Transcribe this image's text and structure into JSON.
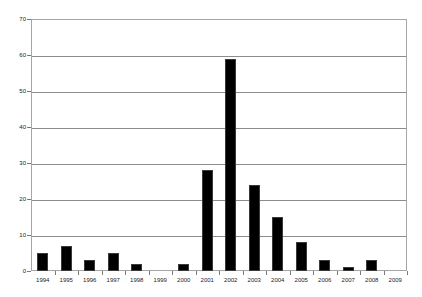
{
  "chart_data": {
    "type": "bar",
    "title": "",
    "subtitle": "",
    "xlabel": "",
    "ylabel": "",
    "categories": [
      "1994",
      "1995",
      "1996",
      "1997",
      "1998",
      "1999",
      "2000",
      "2001",
      "2002",
      "2003",
      "2004",
      "2005",
      "2006",
      "2007",
      "2008",
      "2009"
    ],
    "values": [
      5,
      7,
      3,
      5,
      2,
      0,
      2,
      28,
      59,
      24,
      15,
      8,
      3,
      1,
      3,
      0
    ],
    "ylim": [
      0,
      70
    ],
    "ytick_labels": [
      "0",
      "10",
      "20",
      "30",
      "40",
      "50",
      "60",
      "70"
    ],
    "ytick_values": [
      0,
      10,
      20,
      30,
      40,
      50,
      60,
      70
    ],
    "grid": true,
    "grid_axis": "y",
    "legend": false,
    "legend_position": "none",
    "series": [
      {
        "name": "",
        "values": [
          5,
          7,
          3,
          5,
          2,
          0,
          2,
          28,
          59,
          24,
          15,
          8,
          3,
          1,
          3,
          0
        ]
      }
    ],
    "colors": {
      "bar_fill": "#000000",
      "bar_stroke": "#3a3a3a",
      "gridline": "#8c8c8c",
      "frame": "#a6a6a6",
      "axis_text": "#1a1a1a",
      "background": "#ffffff"
    },
    "annotations": []
  }
}
